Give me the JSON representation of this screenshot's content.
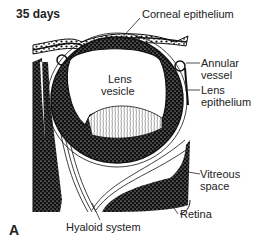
{
  "figure": {
    "title": "35 days",
    "panel_letter": "A"
  },
  "labels": {
    "corneal_epithelium": "Corneal epithelium",
    "annular_vessel_1": "Annular",
    "annular_vessel_2": "vessel",
    "lens_epithelium_1": "Lens",
    "lens_epithelium_2": "epithelium",
    "lens_vesicle_1": "Lens",
    "lens_vesicle_2": "vesicle",
    "vitreous_space_1": "Vitreous",
    "vitreous_space_2": "space",
    "retina": "Retina",
    "hyaloid_system": "Hyaloid system"
  },
  "colors": {
    "ink": "#111111",
    "paper": "#ffffff"
  }
}
